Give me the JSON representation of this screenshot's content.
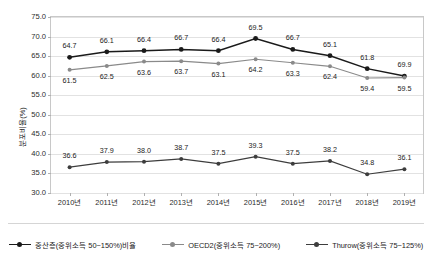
{
  "chart_data": {
    "type": "line",
    "title": "",
    "xlabel": "",
    "ylabel": "분포비율(%)",
    "ylim": [
      30.0,
      75.0
    ],
    "ytick_step": 5.0,
    "grid": true,
    "legend_position": "bottom",
    "categories": [
      "2010년",
      "2011년",
      "2012년",
      "2013년",
      "2014년",
      "2015년",
      "2016년",
      "2017년",
      "2018년",
      "2019년"
    ],
    "yticks": [
      "30.0",
      "35.0",
      "40.0",
      "45.0",
      "50.0",
      "55.0",
      "60.0",
      "65.0",
      "70.0",
      "75.0"
    ],
    "series": [
      {
        "name": "중산층(중위소득 50~150%)비율",
        "color": "#1a1a1a",
        "values": [
          64.7,
          66.1,
          66.4,
          66.7,
          66.4,
          69.5,
          66.7,
          65.1,
          61.8,
          59.9
        ],
        "labels": [
          "64.7",
          "66.1",
          "66.4",
          "66.7",
          "66.4",
          "69.5",
          "66.7",
          "65.1",
          "61.8",
          "69.9"
        ],
        "label_offsets": [
          -11,
          -11,
          -11,
          -11,
          -11,
          -11,
          -11,
          -11,
          -11,
          -11
        ]
      },
      {
        "name": "OECD2(중위소득 75~200%)",
        "color": "#8a8a8a",
        "values": [
          61.5,
          62.5,
          63.6,
          63.7,
          63.1,
          64.2,
          63.3,
          62.4,
          59.4,
          59.5
        ],
        "labels": [
          "61.5",
          "62.5",
          "63.6",
          "63.7",
          "63.1",
          "64.2",
          "63.3",
          "62.4",
          "59.4",
          "59.5"
        ],
        "label_offsets": [
          11,
          11,
          11,
          11,
          11,
          11,
          11,
          11,
          11,
          11
        ]
      },
      {
        "name": "Thurow(중위소득 75~125%)",
        "color": "#3d3d3d",
        "values": [
          36.6,
          37.9,
          38.0,
          38.7,
          37.5,
          39.3,
          37.5,
          38.2,
          34.8,
          36.1
        ],
        "labels": [
          "36.6",
          "37.9",
          "38.0",
          "38.7",
          "37.5",
          "39.3",
          "37.5",
          "38.2",
          "34.8",
          "36.1"
        ],
        "label_offsets": [
          -11,
          -11,
          -11,
          -11,
          -11,
          -11,
          -11,
          -11,
          -11,
          -11
        ]
      }
    ]
  }
}
